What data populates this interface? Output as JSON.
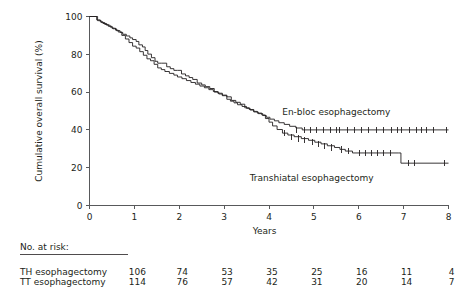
{
  "chart_data": {
    "type": "line",
    "subtype": "kaplan-meier-survival",
    "title": "",
    "xlabel": "Years",
    "ylabel": "Cumulative overall survival (%)",
    "xlim": [
      0,
      8
    ],
    "ylim": [
      0,
      100
    ],
    "xticks": [
      0,
      1,
      2,
      3,
      4,
      5,
      6,
      7,
      8
    ],
    "xticklabels": [
      "0",
      "1",
      "2",
      "3",
      "4",
      "5",
      "6",
      "7",
      "8"
    ],
    "yticks": [
      0,
      20,
      40,
      60,
      80,
      100
    ],
    "yticklabels": [
      "0",
      "20",
      "40",
      "60",
      "80",
      "100"
    ],
    "grid": false,
    "legend_position": "inline-annotation",
    "series": [
      {
        "name": "En-bloc esophagectomy",
        "label": "En-bloc esophagectomy",
        "label_x": 5.5,
        "label_y": 48,
        "points": [
          [
            0.0,
            100
          ],
          [
            0.1,
            100
          ],
          [
            0.16,
            98.2
          ],
          [
            0.24,
            97.2
          ],
          [
            0.3,
            96.3
          ],
          [
            0.38,
            95.4
          ],
          [
            0.46,
            94.4
          ],
          [
            0.52,
            93.5
          ],
          [
            0.6,
            92.5
          ],
          [
            0.68,
            91.6
          ],
          [
            0.74,
            90.6
          ],
          [
            0.82,
            89.7
          ],
          [
            0.9,
            88.7
          ],
          [
            0.96,
            87.8
          ],
          [
            1.04,
            86.8
          ],
          [
            1.1,
            85.0
          ],
          [
            1.18,
            83.9
          ],
          [
            1.24,
            82.0
          ],
          [
            1.3,
            80.1
          ],
          [
            1.38,
            78.2
          ],
          [
            1.46,
            76.3
          ],
          [
            1.52,
            75.3
          ],
          [
            1.6,
            75.3
          ],
          [
            1.72,
            73.4
          ],
          [
            1.8,
            72.4
          ],
          [
            1.88,
            71.5
          ],
          [
            1.96,
            71.5
          ],
          [
            2.05,
            69.6
          ],
          [
            2.14,
            68.6
          ],
          [
            2.22,
            67.7
          ],
          [
            2.3,
            66.7
          ],
          [
            2.4,
            64.8
          ],
          [
            2.5,
            63.8
          ],
          [
            2.58,
            62.9
          ],
          [
            2.68,
            61.9
          ],
          [
            2.78,
            60.0
          ],
          [
            2.88,
            59.0
          ],
          [
            2.96,
            58.1
          ],
          [
            3.06,
            56.2
          ],
          [
            3.14,
            55.2
          ],
          [
            3.22,
            54.3
          ],
          [
            3.3,
            53.3
          ],
          [
            3.4,
            52.4
          ],
          [
            3.5,
            51.4
          ],
          [
            3.58,
            50.5
          ],
          [
            3.66,
            49.5
          ],
          [
            3.76,
            48.6
          ],
          [
            3.86,
            47.6
          ],
          [
            3.94,
            46.7
          ],
          [
            4.02,
            45.7
          ],
          [
            4.12,
            44.8
          ],
          [
            4.22,
            43.8
          ],
          [
            4.34,
            42.9
          ],
          [
            4.46,
            41.9
          ],
          [
            4.6,
            41.0
          ],
          [
            4.74,
            40.0
          ],
          [
            8.0,
            40.0
          ]
        ],
        "censor_marks": [
          [
            4.62,
            40.0
          ],
          [
            4.78,
            40.0
          ],
          [
            4.92,
            40.0
          ],
          [
            5.06,
            40.0
          ],
          [
            5.22,
            40.0
          ],
          [
            5.38,
            40.0
          ],
          [
            5.5,
            40.0
          ],
          [
            5.58,
            40.0
          ],
          [
            5.74,
            40.0
          ],
          [
            5.9,
            40.0
          ],
          [
            6.06,
            40.0
          ],
          [
            6.22,
            40.0
          ],
          [
            6.4,
            40.0
          ],
          [
            6.56,
            40.0
          ],
          [
            6.74,
            40.0
          ],
          [
            6.86,
            40.0
          ],
          [
            6.96,
            40.0
          ],
          [
            7.12,
            40.0
          ],
          [
            7.28,
            40.0
          ],
          [
            7.4,
            40.0
          ],
          [
            7.52,
            40.0
          ],
          [
            7.66,
            40.0
          ],
          [
            7.96,
            40.0
          ]
        ]
      },
      {
        "name": "Transhiatal esophagectomy",
        "label": "Transhiatal esophagectomy",
        "label_x": 4.95,
        "label_y": 13,
        "points": [
          [
            0.0,
            100
          ],
          [
            0.12,
            100
          ],
          [
            0.18,
            97.8
          ],
          [
            0.26,
            96.8
          ],
          [
            0.34,
            95.8
          ],
          [
            0.42,
            94.8
          ],
          [
            0.5,
            93.8
          ],
          [
            0.58,
            92.8
          ],
          [
            0.64,
            91.8
          ],
          [
            0.72,
            90.0
          ],
          [
            0.8,
            88.1
          ],
          [
            0.88,
            86.2
          ],
          [
            0.96,
            84.3
          ],
          [
            1.04,
            83.3
          ],
          [
            1.12,
            81.4
          ],
          [
            1.2,
            79.5
          ],
          [
            1.28,
            77.6
          ],
          [
            1.36,
            76.6
          ],
          [
            1.44,
            74.7
          ],
          [
            1.52,
            72.8
          ],
          [
            1.6,
            71.9
          ],
          [
            1.68,
            70.9
          ],
          [
            1.78,
            69.9
          ],
          [
            1.88,
            69.0
          ],
          [
            1.96,
            68.0
          ],
          [
            2.06,
            67.1
          ],
          [
            2.16,
            66.1
          ],
          [
            2.26,
            65.1
          ],
          [
            2.36,
            64.2
          ],
          [
            2.46,
            63.2
          ],
          [
            2.56,
            62.3
          ],
          [
            2.66,
            61.3
          ],
          [
            2.76,
            60.3
          ],
          [
            2.86,
            59.4
          ],
          [
            2.96,
            58.4
          ],
          [
            3.06,
            57.5
          ],
          [
            3.16,
            55.6
          ],
          [
            3.26,
            54.6
          ],
          [
            3.36,
            53.6
          ],
          [
            3.46,
            51.7
          ],
          [
            3.56,
            50.8
          ],
          [
            3.66,
            49.8
          ],
          [
            3.74,
            48.9
          ],
          [
            3.84,
            47.9
          ],
          [
            3.92,
            46.0
          ],
          [
            4.0,
            44.1
          ],
          [
            4.08,
            42.1
          ],
          [
            4.18,
            40.2
          ],
          [
            4.3,
            38.3
          ],
          [
            4.42,
            37.3
          ],
          [
            4.56,
            36.4
          ],
          [
            4.72,
            35.4
          ],
          [
            4.88,
            34.5
          ],
          [
            5.02,
            33.5
          ],
          [
            5.16,
            32.6
          ],
          [
            5.3,
            31.6
          ],
          [
            5.46,
            30.7
          ],
          [
            5.58,
            29.7
          ],
          [
            5.7,
            28.8
          ],
          [
            5.86,
            27.8
          ],
          [
            6.88,
            27.8
          ],
          [
            6.94,
            22.4
          ],
          [
            8.0,
            22.4
          ]
        ],
        "censor_marks": [
          [
            4.34,
            38.3
          ],
          [
            4.5,
            36.4
          ],
          [
            4.66,
            35.4
          ],
          [
            4.8,
            34.5
          ],
          [
            4.96,
            33.5
          ],
          [
            5.1,
            32.6
          ],
          [
            5.24,
            31.6
          ],
          [
            5.4,
            30.7
          ],
          [
            5.62,
            29.7
          ],
          [
            5.78,
            28.8
          ],
          [
            6.02,
            27.8
          ],
          [
            6.16,
            27.8
          ],
          [
            6.28,
            27.8
          ],
          [
            6.42,
            27.8
          ],
          [
            6.56,
            27.8
          ],
          [
            6.7,
            27.8
          ],
          [
            7.1,
            22.4
          ],
          [
            7.24,
            22.4
          ],
          [
            7.92,
            22.4
          ]
        ]
      }
    ]
  },
  "risk_table": {
    "title": "No. at risk:",
    "columns": [
      0,
      1,
      2,
      3,
      4,
      5,
      6,
      7,
      8
    ],
    "rows": [
      {
        "label": "TH esophagectomy",
        "values": [
          "",
          "",
          "106",
          "74",
          "53",
          "35",
          "25",
          "16",
          "11",
          "4"
        ]
      },
      {
        "label": "TT esophagectomy",
        "values": [
          "",
          "",
          "114",
          "76",
          "57",
          "42",
          "31",
          "20",
          "14",
          "7"
        ]
      }
    ]
  },
  "colors": {
    "curve": "#231f20",
    "axis": "#58595b",
    "text": "#231f20",
    "background": "#ffffff"
  }
}
